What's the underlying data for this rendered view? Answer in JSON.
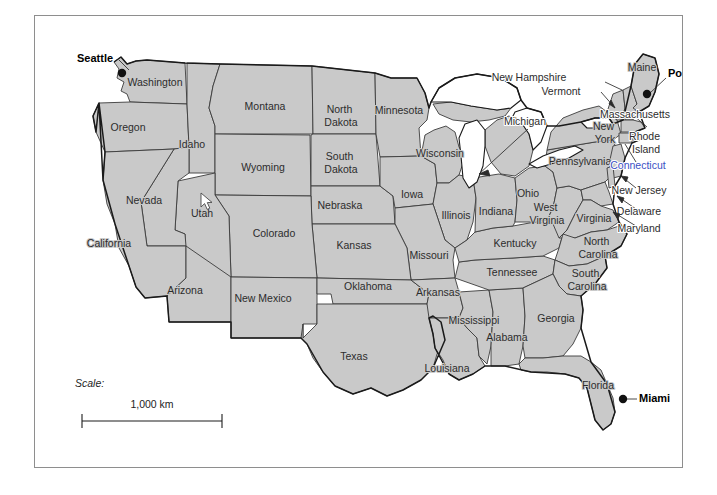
{
  "figure": {
    "kind": "reference-map",
    "background_color": "#ffffff",
    "frame_color": "#8e8e8e",
    "land_fill": "#c9c9c9",
    "water_fill": "#ffffff",
    "label_color": "#2c2c2c",
    "city_color": "#000000",
    "highlight_color": "#3a4fc4"
  },
  "states": [
    {
      "name": "Washington",
      "x": 120,
      "y": 67
    },
    {
      "name": "Oregon",
      "x": 93,
      "y": 112
    },
    {
      "name": "Idaho",
      "x": 157,
      "y": 129
    },
    {
      "name": "Montana",
      "x": 230,
      "y": 91
    },
    {
      "name": "Wyoming",
      "x": 228,
      "y": 152
    },
    {
      "name": "Nevada",
      "x": 109,
      "y": 185
    },
    {
      "name": "Utah",
      "x": 167,
      "y": 198
    },
    {
      "name": "California",
      "x": 74,
      "y": 228
    },
    {
      "name": "Colorado",
      "x": 239,
      "y": 218
    },
    {
      "name": "Arizona",
      "x": 150,
      "y": 275
    },
    {
      "name": "New Mexico",
      "x": 228,
      "y": 283
    },
    {
      "name": "North Dakota",
      "x": 306,
      "y": 100,
      "lines": [
        "North",
        "Dakota"
      ]
    },
    {
      "name": "South Dakota",
      "x": 306,
      "y": 147,
      "lines": [
        "South",
        "Dakota"
      ]
    },
    {
      "name": "Nebraska",
      "x": 305,
      "y": 190
    },
    {
      "name": "Kansas",
      "x": 319,
      "y": 230
    },
    {
      "name": "Oklahoma",
      "x": 333,
      "y": 271
    },
    {
      "name": "Texas",
      "x": 319,
      "y": 341
    },
    {
      "name": "Minnesota",
      "x": 364,
      "y": 95
    },
    {
      "name": "Iowa",
      "x": 377,
      "y": 179
    },
    {
      "name": "Missouri",
      "x": 394,
      "y": 240
    },
    {
      "name": "Arkansas",
      "x": 403,
      "y": 277
    },
    {
      "name": "Louisiana",
      "x": 412,
      "y": 353
    },
    {
      "name": "Wisconsin",
      "x": 405,
      "y": 138
    },
    {
      "name": "Illinois",
      "x": 421,
      "y": 200
    },
    {
      "name": "Mississippi",
      "x": 439,
      "y": 305
    },
    {
      "name": "Indiana",
      "x": 461,
      "y": 196
    },
    {
      "name": "Alabama",
      "x": 472,
      "y": 322
    },
    {
      "name": "Michigan",
      "x": 516,
      "y": 93
    },
    {
      "name": "Ohio",
      "x": 493,
      "y": 178
    },
    {
      "name": "Kentucky",
      "x": 480,
      "y": 228
    },
    {
      "name": "Tennessee",
      "x": 477,
      "y": 257
    },
    {
      "name": "West Virginia",
      "x": 512,
      "y": 198,
      "lines": [
        "West",
        "Virginia"
      ]
    },
    {
      "name": "Virginia",
      "x": 559,
      "y": 203
    },
    {
      "name": "North Carolina",
      "x": 563,
      "y": 232,
      "lines": [
        "North",
        "Carolina"
      ]
    },
    {
      "name": "South Carolina",
      "x": 552,
      "y": 264,
      "lines": [
        "South",
        "Carolina"
      ]
    },
    {
      "name": "Georgia",
      "x": 521,
      "y": 303
    },
    {
      "name": "Florida",
      "x": 563,
      "y": 370
    },
    {
      "name": "Pennsylvania",
      "x": 545,
      "y": 146
    },
    {
      "name": "New York",
      "x": 570,
      "y": 117,
      "lines": [
        "New",
        "York"
      ]
    },
    {
      "name": "Maine",
      "x": 607,
      "y": 52
    }
  ],
  "callouts": [
    {
      "name": "New Hampshire",
      "label_x": 494,
      "label_y": 62,
      "anchor": "start",
      "leader": "M 570,66 L 587,74",
      "highlight": false
    },
    {
      "name": "Vermont",
      "label_x": 526,
      "label_y": 76,
      "anchor": "start",
      "leader": "M 566,80 L 578,91",
      "highlight": false
    },
    {
      "name": "Massachusetts",
      "label_x": 600,
      "label_y": 99,
      "anchor": "start",
      "leader": "M 598,99 L 590,101",
      "highlight": false
    },
    {
      "name": "Rhode Island",
      "label_x": 611,
      "label_y": 127,
      "anchor": "start",
      "lines": [
        "Rhode",
        "Island"
      ],
      "leader": "M 609,129 L 597,124",
      "highlight": false
    },
    {
      "name": "Connecticut",
      "label_x": 603,
      "label_y": 150,
      "anchor": "start",
      "leader": "M 601,148 L 588,131",
      "highlight": true
    },
    {
      "name": "New Jersey",
      "label_x": 604,
      "label_y": 175,
      "anchor": "start",
      "leader": "M 602,173 L 584,164",
      "highlight": false
    },
    {
      "name": "Delaware",
      "label_x": 604,
      "label_y": 196,
      "anchor": "start",
      "leader": "M 602,194 L 585,186",
      "highlight": false
    },
    {
      "name": "Maryland",
      "label_x": 604,
      "label_y": 213,
      "anchor": "start",
      "leader": "M 602,211 L 582,203",
      "highlight": false
    },
    {
      "name": "Michigan",
      "label_x": 490,
      "label_y": 106,
      "anchor": "start",
      "leader": "M 494,112 L 443,158",
      "highlight": false,
      "is_state_pointer": true
    }
  ],
  "cities": [
    {
      "name": "Seattle",
      "label_x": 42,
      "label_y": 43,
      "anchor": "start",
      "dot_x": 87,
      "dot_y": 57,
      "leader": "M 84,45 L 92,52"
    },
    {
      "name": "Portland",
      "label_x": 633,
      "label_y": 58,
      "anchor": "start",
      "dot_x": 612,
      "dot_y": 78,
      "leader": "M 631,62 L 614,76"
    },
    {
      "name": "Miami",
      "label_x": 604,
      "label_y": 383,
      "anchor": "start",
      "dot_x": 588,
      "dot_y": 383,
      "leader": "M 602,383 L 590,383"
    }
  ],
  "scale": {
    "label": "Scale:",
    "value": "1,000 km",
    "label_x": 40,
    "label_y": 371,
    "bar_x1": 47,
    "bar_x2": 187,
    "bar_y": 405,
    "value_x": 117,
    "value_y": 392
  },
  "cursor": {
    "name": "mouse-pointer",
    "x": 165,
    "y": 176
  }
}
